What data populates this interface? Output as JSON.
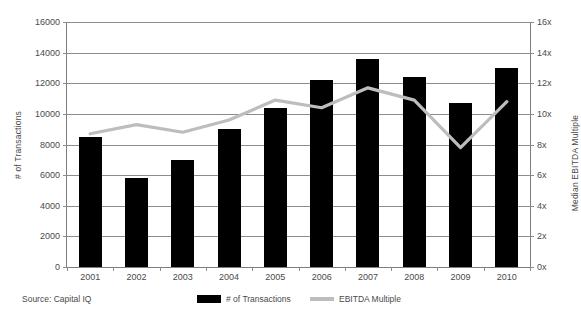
{
  "chart_data": {
    "type": "bar",
    "title": "",
    "subtitle": "",
    "xlabel": "",
    "categories": [
      "2001",
      "2002",
      "2003",
      "2004",
      "2005",
      "2006",
      "2007",
      "2008",
      "2009",
      "2010"
    ],
    "series": [
      {
        "name": "# of Transactions",
        "type": "bar",
        "axis": "left",
        "color": "#000000",
        "values": [
          8500,
          5800,
          7000,
          9000,
          10400,
          12200,
          13600,
          12400,
          10700,
          13000
        ]
      },
      {
        "name": "EBITDA Multiple",
        "type": "line",
        "axis": "right",
        "color": "#bdbdbd",
        "values": [
          8.7,
          9.3,
          8.8,
          9.6,
          10.9,
          10.4,
          11.7,
          10.9,
          7.8,
          10.8
        ]
      }
    ],
    "left_axis": {
      "label": "# of Transactions",
      "ylim": [
        0,
        16000
      ],
      "tick_step": 2000,
      "ticks": [
        "0",
        "2000",
        "4000",
        "6000",
        "8000",
        "10000",
        "12000",
        "14000",
        "16000"
      ],
      "tick_values": [
        0,
        2000,
        4000,
        6000,
        8000,
        10000,
        12000,
        14000,
        16000
      ]
    },
    "right_axis": {
      "label": "Median EBITDA Multiple",
      "ylim": [
        0,
        16
      ],
      "tick_step": 2,
      "ticks": [
        "0x",
        "2x",
        "4x",
        "6x",
        "8x",
        "10x",
        "12x",
        "14x",
        "16x"
      ],
      "tick_values": [
        0,
        2,
        4,
        6,
        8,
        10,
        12,
        14,
        16
      ]
    },
    "grid": true,
    "legend_position": "bottom"
  },
  "legend": [
    {
      "label": "# of Transactions",
      "color": "#000000",
      "marker": "square"
    },
    {
      "label": "EBITDA Multiple",
      "color": "#bdbdbd",
      "marker": "line"
    }
  ],
  "footer": {
    "source": "Source:  Capital IQ"
  },
  "colors": {
    "bar": "#000000",
    "line": "#bdbdbd",
    "grid": "#8c8c8c",
    "axis": "#7d7d7d",
    "text": "#4a4a4a",
    "background": "#ffffff"
  }
}
